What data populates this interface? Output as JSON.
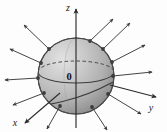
{
  "figure": {
    "kind": "3d-sphere-outward-normal-vector-field",
    "background_color": "#fdfdfd",
    "origin_label": "0",
    "axes": [
      {
        "name": "z",
        "label": "z",
        "direction": "up",
        "tip": [
          76,
          8
        ],
        "tail": [
          76,
          128
        ]
      },
      {
        "name": "y",
        "label": "y",
        "direction": "right",
        "tip": [
          157,
          97
        ],
        "tail": [
          76,
          76
        ]
      },
      {
        "name": "x",
        "label": "x",
        "direction": "down-left",
        "tip": [
          24,
          124
        ],
        "tail": [
          76,
          76
        ]
      }
    ],
    "axis_labels": {
      "z": {
        "text": "z",
        "x": 68,
        "y": 11
      },
      "y": {
        "text": "y",
        "x": 151,
        "y": 111
      },
      "x": {
        "text": "x",
        "x": 15,
        "y": 126
      }
    },
    "sphere": {
      "center_x": 76,
      "center_y": 76,
      "radius": 38,
      "fill_light": "#d8d8d8",
      "fill_mid": "#b4b4b4",
      "fill_dark": "#8e8e8e",
      "outline_color": "#4a4a4a",
      "highlight_x": 58,
      "highlight_y": 52
    },
    "equator": {
      "name": "equator-ellipse",
      "rx": 38,
      "ry": 11,
      "cy": 72,
      "front_style": "solid",
      "back_style": "dashed"
    },
    "tilted_circle": {
      "name": "tilted-great-circle",
      "rx": 38,
      "ry": 12,
      "rotation_deg": -22,
      "style": "solid"
    },
    "normal_vectors": [
      {
        "id": 1,
        "base": [
          76,
          38
        ],
        "tip": [
          76,
          10
        ],
        "label": "normal-up"
      },
      {
        "id": 2,
        "base": [
          103,
          49
        ],
        "tip": [
          128,
          24
        ],
        "label": "normal-upper-right"
      },
      {
        "id": 3,
        "base": [
          111,
          61
        ],
        "tip": [
          143,
          44
        ],
        "label": "normal-right-upper"
      },
      {
        "id": 4,
        "base": [
          113,
          74
        ],
        "tip": [
          152,
          72
        ],
        "label": "normal-right"
      },
      {
        "id": 5,
        "base": [
          108,
          92
        ],
        "tip": [
          140,
          112
        ],
        "label": "normal-lower-right"
      },
      {
        "id": 6,
        "base": [
          92,
          106
        ],
        "tip": [
          106,
          130
        ],
        "label": "normal-bottom-right"
      },
      {
        "id": 7,
        "base": [
          49,
          49
        ],
        "tip": [
          24,
          26
        ],
        "label": "normal-upper-left"
      },
      {
        "id": 8,
        "base": [
          41,
          62
        ],
        "tip": [
          9,
          48
        ],
        "label": "normal-left-upper"
      },
      {
        "id": 9,
        "base": [
          39,
          76
        ],
        "tip": [
          4,
          78
        ],
        "label": "normal-left"
      },
      {
        "id": 10,
        "base": [
          44,
          92
        ],
        "tip": [
          12,
          104
        ],
        "label": "normal-lower-left"
      },
      {
        "id": 11,
        "base": [
          60,
          105
        ],
        "tip": [
          46,
          128
        ],
        "label": "normal-bottom-left"
      },
      {
        "id": 12,
        "base": [
          90,
          43
        ],
        "tip": [
          112,
          20
        ],
        "label": "normal-top-right-inner"
      }
    ],
    "arrow_color": "#3a3a3a",
    "dot_color": "#3c3c3c",
    "dot_radius": 1.9
  }
}
